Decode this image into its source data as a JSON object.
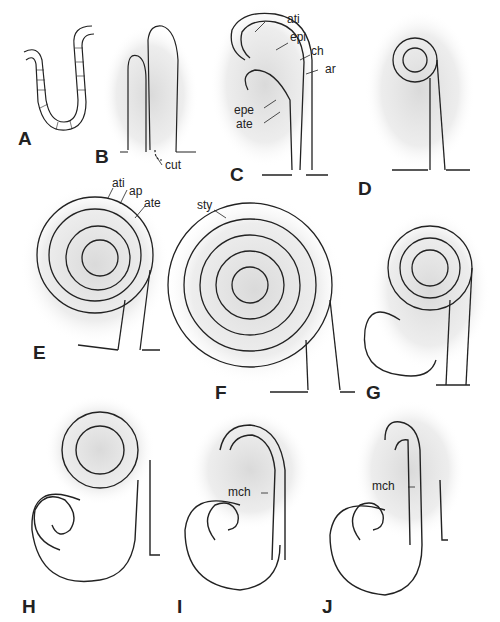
{
  "figure": {
    "panels": [
      {
        "id": "A",
        "label": "A",
        "x": 18,
        "y": 128
      },
      {
        "id": "B",
        "label": "B",
        "x": 95,
        "y": 146
      },
      {
        "id": "C",
        "label": "C",
        "x": 230,
        "y": 164
      },
      {
        "id": "D",
        "label": "D",
        "x": 358,
        "y": 178
      },
      {
        "id": "E",
        "label": "E",
        "x": 33,
        "y": 342
      },
      {
        "id": "F",
        "label": "F",
        "x": 215,
        "y": 382
      },
      {
        "id": "G",
        "label": "G",
        "x": 366,
        "y": 382
      },
      {
        "id": "H",
        "label": "H",
        "x": 22,
        "y": 596
      },
      {
        "id": "I",
        "label": "I",
        "x": 177,
        "y": 596
      },
      {
        "id": "J",
        "label": "J",
        "x": 322,
        "y": 596
      }
    ],
    "annotations": {
      "cut": "cut",
      "c_ati": "ati",
      "c_epi": "epi",
      "c_ch": "ch",
      "c_ar": "ar",
      "c_epe": "epe",
      "c_ate": "ate",
      "e_ati": "ati",
      "e_ap": "ap",
      "e_ate": "ate",
      "f_sty": "sty",
      "i_mch": "mch",
      "j_mch": "mch"
    }
  }
}
